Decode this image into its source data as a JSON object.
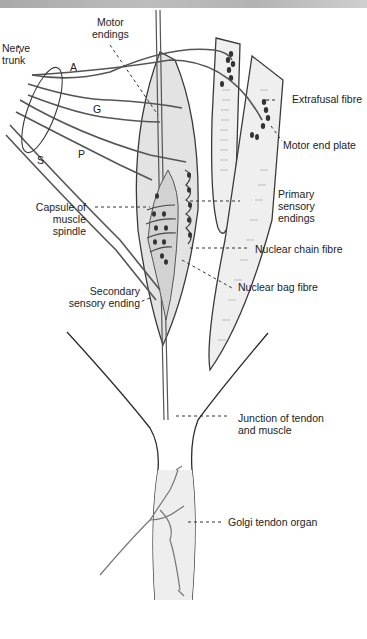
{
  "figure": {
    "labels": {
      "motor_endings": [
        "Motor",
        "endings"
      ],
      "nerve_trunk": [
        "Nerve",
        "trunk"
      ],
      "a": "A",
      "g": "G",
      "p": "P",
      "s": "S",
      "extrafusal_fibre": "Extrafusal fibre",
      "motor_end_plate": "Motor end plate",
      "capsule": [
        "Capsule of",
        "muscle",
        "spindle"
      ],
      "primary_sensory": [
        "Primary",
        "sensory",
        "endings"
      ],
      "nuclear_chain": "Nuclear chain fibre",
      "nuclear_bag": "Nuclear bag fibre",
      "secondary_sensory": [
        "Secondary",
        "sensory ending"
      ],
      "junction": [
        "Junction of tendon",
        "and muscle"
      ],
      "golgi": "Golgi tendon organ"
    },
    "colors": {
      "line": "#3a3a3a",
      "nerve": "#555555",
      "fill": "#e6e6e6",
      "nucleus": "#333333",
      "label": "#222222"
    }
  }
}
